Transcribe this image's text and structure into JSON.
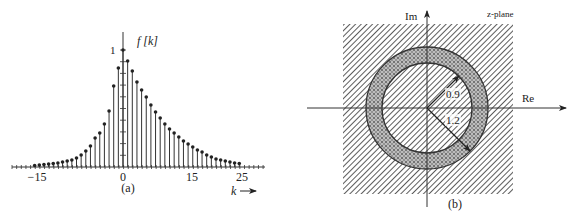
{
  "figure_a": {
    "caption": "(a)",
    "y_label": "f [k]",
    "y_tick_label": "1",
    "x_axis_label": "k",
    "x_axis_arrow": "→",
    "x_tick_labels": [
      {
        "text": "−15",
        "x": 37
      },
      {
        "text": "0",
        "x": 123
      },
      {
        "text": "15",
        "x": 192
      },
      {
        "text": "25",
        "x": 242
      }
    ]
  },
  "figure_b": {
    "caption": "(b)",
    "plane_label": "z-plane",
    "real_axis_label": "Re",
    "imag_axis_label": "Im",
    "inner_radius_label": "0.9",
    "outer_radius_label": "1.2",
    "inner_radius": 0.9,
    "outer_radius": 1.2
  },
  "chart_data": {
    "type": "stem",
    "xlabel": "k",
    "ylabel": "f[k]",
    "ylim": [
      0,
      1
    ],
    "left_stems_y": [
      165.5,
      165,
      164.5,
      164,
      163.5,
      163,
      162,
      161,
      160,
      158,
      155,
      151,
      146,
      138,
      133,
      124,
      111,
      86,
      68
    ],
    "peak_y": 50,
    "right_stems_y": [
      61,
      71,
      82,
      90,
      97,
      105,
      112,
      118,
      124,
      129,
      133,
      137,
      141,
      144,
      147,
      150,
      152,
      155,
      157,
      159,
      160,
      161,
      162,
      163,
      163.5
    ],
    "points": [
      {
        "k": 0,
        "value": 1.0
      },
      {
        "k": 1,
        "value": 0.91
      },
      {
        "k": 2,
        "value": 0.82
      },
      {
        "k": 3,
        "value": 0.74
      },
      {
        "k": 4,
        "value": 0.68
      },
      {
        "k": 5,
        "value": 0.62
      },
      {
        "k": 6,
        "value": 0.53
      },
      {
        "k": 7,
        "value": 0.47
      },
      {
        "k": 8,
        "value": 0.42
      },
      {
        "k": 9,
        "value": 0.37
      },
      {
        "k": 10,
        "value": 0.32
      },
      {
        "k": 11,
        "value": 0.29
      },
      {
        "k": 12,
        "value": 0.26
      },
      {
        "k": 13,
        "value": 0.22
      },
      {
        "k": 14,
        "value": 0.2
      },
      {
        "k": 15,
        "value": 0.17
      },
      {
        "k": 16,
        "value": 0.15
      },
      {
        "k": 17,
        "value": 0.13
      },
      {
        "k": 18,
        "value": 0.1
      },
      {
        "k": 19,
        "value": 0.09
      },
      {
        "k": 20,
        "value": 0.07
      },
      {
        "k": 21,
        "value": 0.06
      },
      {
        "k": 22,
        "value": 0.05
      },
      {
        "k": 23,
        "value": 0.04
      },
      {
        "k": 24,
        "value": 0.03
      },
      {
        "k": 25,
        "value": 0.03
      },
      {
        "k": -1,
        "value": 0.85
      },
      {
        "k": -2,
        "value": 0.7
      },
      {
        "k": -3,
        "value": 0.48
      },
      {
        "k": -4,
        "value": 0.37
      },
      {
        "k": -5,
        "value": 0.29
      },
      {
        "k": -6,
        "value": 0.25
      },
      {
        "k": -7,
        "value": 0.18
      },
      {
        "k": -8,
        "value": 0.14
      },
      {
        "k": -9,
        "value": 0.1
      },
      {
        "k": -10,
        "value": 0.08
      },
      {
        "k": -11,
        "value": 0.06
      },
      {
        "k": -12,
        "value": 0.05
      },
      {
        "k": -13,
        "value": 0.04
      },
      {
        "k": -14,
        "value": 0.03
      },
      {
        "k": -15,
        "value": 0.03
      }
    ],
    "x_tick_labels": [
      "-15",
      "0",
      "15",
      "25"
    ],
    "y_tick_labels": [
      "1"
    ]
  }
}
